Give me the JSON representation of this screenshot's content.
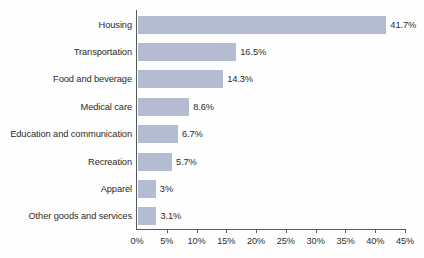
{
  "chart_data": {
    "type": "bar",
    "orientation": "horizontal",
    "title": "",
    "subtitle": "",
    "xlabel": "",
    "ylabel": "",
    "xlim": [
      0,
      45
    ],
    "grid": false,
    "legend": null,
    "bar_color": "#b3bcd0",
    "axis_color": "#55585c",
    "text_color": "#2b2b2b",
    "xtick_labels": [
      "0%",
      "5%",
      "10%",
      "15%",
      "20%",
      "25%",
      "30%",
      "35%",
      "40%",
      "45%"
    ],
    "xtick_values": [
      0,
      5,
      10,
      15,
      20,
      25,
      30,
      35,
      40,
      45
    ],
    "categories": [
      "Housing",
      "Transportation",
      "Food and beverage",
      "Medical care",
      "Education and communication",
      "Recreation",
      "Apparel",
      "Other goods and services"
    ],
    "values": [
      41.7,
      16.5,
      14.3,
      8.6,
      6.7,
      5.7,
      3.0,
      3.1
    ],
    "data_labels": [
      "41.7%",
      "16.5%",
      "14.3%",
      "8.6%",
      "6.7%",
      "5.7%",
      "3%",
      "3.1%"
    ]
  }
}
